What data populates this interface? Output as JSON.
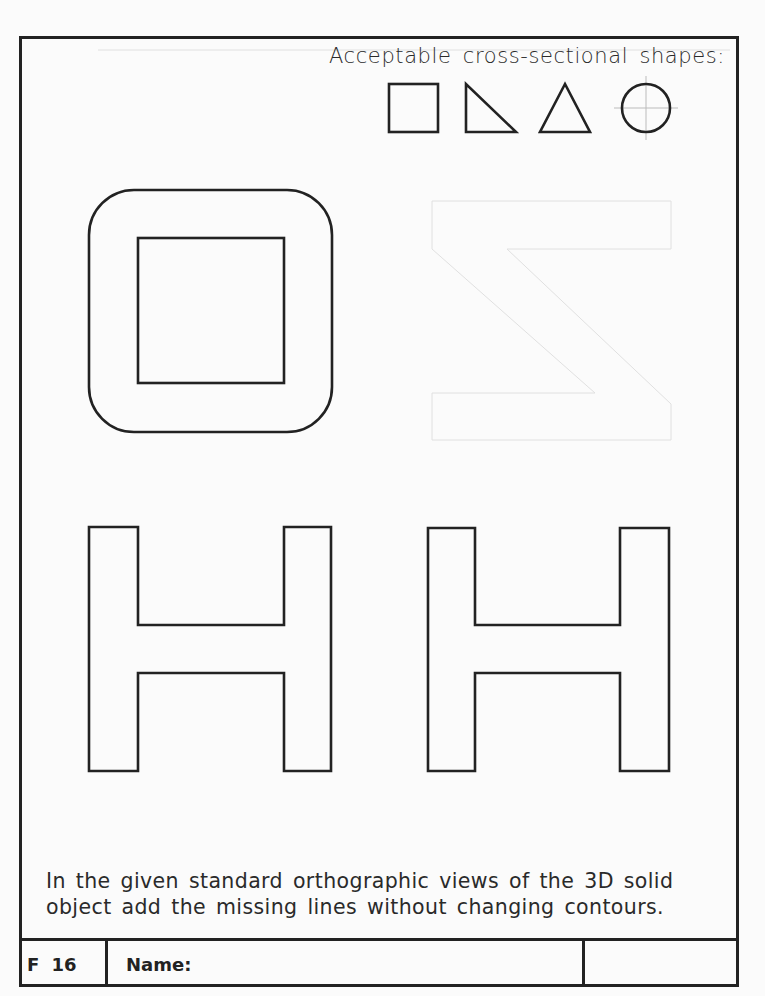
{
  "sheet": {
    "heading": "Acceptable cross-sectional shapes:",
    "acceptable_shapes": [
      {
        "name": "square",
        "icon": "square-icon"
      },
      {
        "name": "right triangle",
        "icon": "right-triangle-icon"
      },
      {
        "name": "triangle",
        "icon": "triangle-icon"
      },
      {
        "name": "circle",
        "icon": "circle-with-centerlines-icon"
      }
    ],
    "views": [
      {
        "name": "top view",
        "shape": "rounded square with square hole"
      },
      {
        "name": "front view",
        "shape": "H profile"
      },
      {
        "name": "side view",
        "shape": "H profile"
      }
    ],
    "instructions": "In the given standard orthographic views of the 3D solid object add the missing lines without changing contours.",
    "footer": {
      "sheet_id": "F 16",
      "name_label": "Name:",
      "extra": ""
    },
    "colors": {
      "ink": "#222222",
      "paper": "#fbfbfb",
      "bleed_through": "#dcdcdc",
      "centerline": "#bbbbbb"
    }
  }
}
